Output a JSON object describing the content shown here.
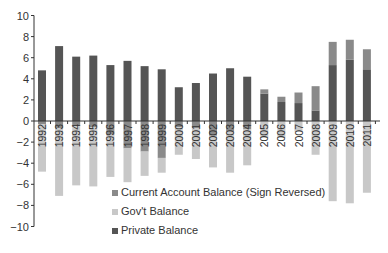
{
  "chart_data": {
    "type": "bar",
    "stacked": true,
    "title": "",
    "xlabel": "",
    "ylabel": "",
    "ylim": [
      -10,
      10
    ],
    "yticks": [
      10,
      8,
      6,
      4,
      2,
      0,
      -2,
      -4,
      -6,
      -8,
      -10
    ],
    "grid": false,
    "legend_position": "bottom-center",
    "categories": [
      "1992",
      "1993",
      "1994",
      "1995",
      "1996",
      "1997",
      "1998",
      "1999",
      "2000",
      "2001",
      "2002",
      "2003",
      "2004",
      "2005",
      "2006",
      "2007",
      "2008",
      "2009",
      "2010",
      "2011"
    ],
    "series": [
      {
        "name": "Current Account Balance (Sign Reversed)",
        "color": "#8a8a8a",
        "values": [
          -0.3,
          -0.7,
          -0.5,
          -0.6,
          -1.3,
          -2.6,
          -2.9,
          -3.5,
          -0.6,
          -0.7,
          -1.4,
          -1.0,
          -0.8,
          0.4,
          0.5,
          1.0,
          2.3,
          2.2,
          1.9,
          1.9
        ]
      },
      {
        "name": "Gov't Balance",
        "color": "#c8c8c8",
        "values": [
          -4.5,
          -6.4,
          -5.6,
          -5.6,
          -4.0,
          -3.2,
          -2.3,
          -1.4,
          -2.6,
          -2.9,
          -3.0,
          -3.9,
          -3.4,
          -1.6,
          -1.6,
          -1.0,
          -3.2,
          -7.6,
          -7.8,
          -6.8
        ]
      },
      {
        "name": "Private Balance",
        "color": "#555555",
        "values": [
          4.8,
          7.1,
          6.1,
          6.2,
          5.3,
          5.7,
          5.2,
          4.9,
          3.2,
          3.6,
          4.5,
          5.0,
          4.2,
          2.6,
          1.8,
          1.7,
          1.0,
          5.3,
          5.8,
          4.9
        ]
      }
    ]
  }
}
